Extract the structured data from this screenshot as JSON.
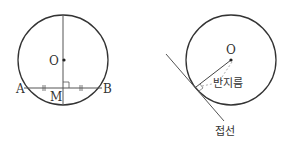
{
  "figures": [
    {
      "id": "chord-bisector",
      "labels": {
        "center": "O",
        "left_point": "A",
        "midpoint": "M",
        "right_point": "B"
      },
      "markers": [
        "equal-segment-ticks",
        "right-angle-mark"
      ]
    },
    {
      "id": "tangent-radius",
      "labels": {
        "center": "O",
        "radius": "반지름",
        "tangent": "접선"
      },
      "markers": [
        "right-angle-mark"
      ]
    }
  ],
  "colors": {
    "stroke": "#333333",
    "dashed": "#999999",
    "background": "#ffffff"
  }
}
